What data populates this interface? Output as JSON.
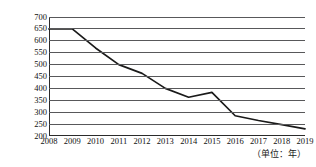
{
  "chart_data": {
    "type": "line",
    "title": "",
    "subtitle": "",
    "xlabel": "（单位：年）",
    "ylabel": "（单位：万亩）",
    "categories": [
      "2008",
      "2009",
      "2010",
      "2011",
      "2012",
      "2013",
      "2014",
      "2015",
      "2016",
      "2017",
      "2018",
      "2019"
    ],
    "x": [
      2008,
      2009,
      2010,
      2011,
      2012,
      2013,
      2014,
      2015,
      2016,
      2017,
      2018,
      2019
    ],
    "values": [
      650,
      650,
      570,
      500,
      463,
      400,
      363,
      383,
      285,
      265,
      248,
      230
    ],
    "series": [
      {
        "name": "面积",
        "values": [
          650,
          650,
          570,
          500,
          463,
          400,
          363,
          383,
          285,
          265,
          248,
          230
        ]
      }
    ],
    "ylim": [
      200,
      700
    ],
    "yticks": [
      700,
      650,
      600,
      550,
      500,
      450,
      400,
      350,
      300,
      250,
      200
    ],
    "xlim": [
      2008,
      2019
    ],
    "grid": true,
    "grid_axis": "y",
    "legend": false,
    "legend_position": "none",
    "line_color": "#1a1a1a",
    "grid_color": "#58585a",
    "axis_color": "#2b2b2b",
    "markers": false
  }
}
